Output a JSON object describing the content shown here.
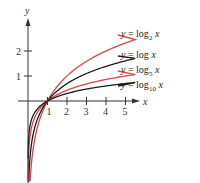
{
  "chart_data": {
    "type": "line",
    "title": "",
    "xlabel": "x",
    "ylabel": "y",
    "x_ticks": [
      1,
      2,
      3,
      4,
      5
    ],
    "y_ticks": [
      1,
      2
    ],
    "xlim": [
      0,
      5.5
    ],
    "ylim": [
      -3,
      3
    ],
    "grid": false,
    "legend_position": "right, inline labels",
    "series": [
      {
        "name": "y = log2 x",
        "base": 2,
        "color": "#d9434a",
        "label_y_px": 35
      },
      {
        "name": "y = log x",
        "base": 2.718281828,
        "color": "#1a1a1a",
        "label_y_px": 56
      },
      {
        "name": "y = log5 x",
        "base": 5,
        "color": "#d9434a",
        "label_y_px": 71
      },
      {
        "name": "y = log10 x",
        "base": 10,
        "color": "#1a1a1a",
        "label_y_px": 86
      }
    ],
    "x": [
      0.02,
      0.05,
      0.1,
      0.2,
      0.3,
      0.5,
      0.75,
      1,
      1.5,
      2,
      2.5,
      3,
      3.5,
      4,
      4.5,
      5,
      5.5
    ]
  },
  "labels": {
    "y_axis": "y",
    "x_axis": "x",
    "series": [
      {
        "prefix": "y = log",
        "sub": "2",
        "var": "x"
      },
      {
        "prefix": "y = log",
        "sub": "",
        "var": "x"
      },
      {
        "prefix": "y = log",
        "sub": "5",
        "var": "x"
      },
      {
        "prefix": "y = log",
        "sub": "10",
        "var": "x"
      }
    ]
  }
}
